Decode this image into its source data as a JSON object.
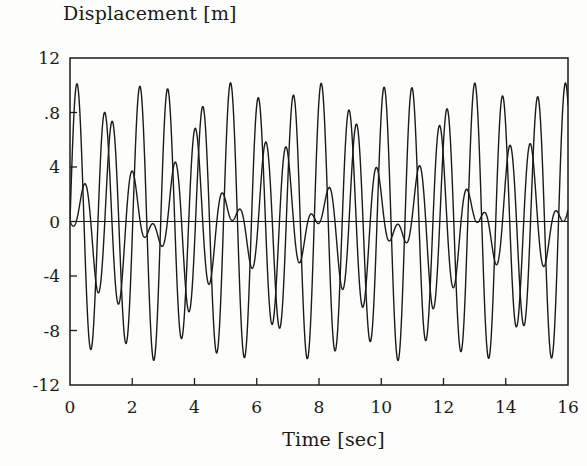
{
  "figure": {
    "background_color": "#ffffff",
    "ink_color": "#1a1a1a",
    "width": 587,
    "height": 466
  },
  "axes": {
    "title_top_left": "Displacement [m]",
    "xlabel": "Time [sec]",
    "ylabel": "Displacement [m]",
    "frame": {
      "left": 70,
      "right": 568,
      "top": 58,
      "bottom": 385
    },
    "zero_line_y": 222
  },
  "chart_data": {
    "type": "line",
    "title": "Displacement [m]",
    "xlabel": "Time [sec]",
    "ylabel": "Displacement [m]",
    "xlim": [
      0,
      16
    ],
    "ylim": [
      -12,
      12
    ],
    "grid": false,
    "legend": null,
    "xticks": [
      0,
      2,
      4,
      6,
      8,
      10,
      12,
      14,
      16
    ],
    "xtick_labels": [
      "0",
      "2",
      "4",
      "6",
      "8",
      "10",
      "12",
      "14",
      "16"
    ],
    "yticks": [
      12,
      8,
      4,
      0,
      -4,
      -8,
      -12
    ],
    "ytick_labels": [
      "12",
      ".8",
      "4",
      "0",
      "-4",
      "-8",
      "-12"
    ],
    "tick_direction": "in",
    "series": [
      {
        "name": "mass-1-displacement",
        "color": "#1a1a1a",
        "line_width": 1.4,
        "model": "beat",
        "amp_a": 5.2,
        "freq_a": 1.02,
        "phase_a": 0.0,
        "amp_b": 5.0,
        "freq_b": 1.21,
        "phase_b": 3.14159
      },
      {
        "name": "mass-2-displacement",
        "color": "#1a1a1a",
        "line_width": 1.4,
        "model": "beat",
        "amp_a": 5.2,
        "freq_a": 1.02,
        "phase_a": 0.0,
        "amp_b": 5.0,
        "freq_b": 1.21,
        "phase_b": 0.0
      }
    ]
  }
}
